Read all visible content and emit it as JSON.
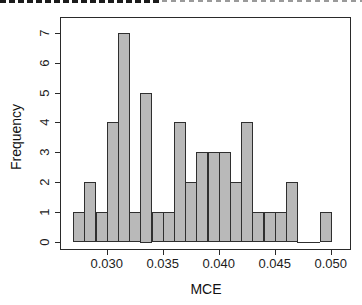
{
  "chart_data": {
    "type": "bar",
    "subtype": "histogram",
    "title": "",
    "xlabel": "MCE",
    "ylabel": "Frequency",
    "xlim": [
      0.027,
      0.05
    ],
    "ylim": [
      0,
      7
    ],
    "bin_width": 0.001,
    "grid": "off",
    "legend": "none",
    "total_count": 50,
    "bins": [
      {
        "from": 0.027,
        "to": 0.028,
        "count": 1
      },
      {
        "from": 0.028,
        "to": 0.029,
        "count": 2
      },
      {
        "from": 0.029,
        "to": 0.03,
        "count": 1
      },
      {
        "from": 0.03,
        "to": 0.031,
        "count": 4
      },
      {
        "from": 0.031,
        "to": 0.032,
        "count": 7
      },
      {
        "from": 0.032,
        "to": 0.033,
        "count": 1
      },
      {
        "from": 0.033,
        "to": 0.034,
        "count": 5
      },
      {
        "from": 0.034,
        "to": 0.035,
        "count": 1
      },
      {
        "from": 0.035,
        "to": 0.036,
        "count": 1
      },
      {
        "from": 0.036,
        "to": 0.037,
        "count": 4
      },
      {
        "from": 0.037,
        "to": 0.038,
        "count": 2
      },
      {
        "from": 0.038,
        "to": 0.039,
        "count": 3
      },
      {
        "from": 0.039,
        "to": 0.04,
        "count": 3
      },
      {
        "from": 0.04,
        "to": 0.041,
        "count": 3
      },
      {
        "from": 0.041,
        "to": 0.042,
        "count": 2
      },
      {
        "from": 0.042,
        "to": 0.043,
        "count": 4
      },
      {
        "from": 0.043,
        "to": 0.044,
        "count": 1
      },
      {
        "from": 0.044,
        "to": 0.045,
        "count": 1
      },
      {
        "from": 0.045,
        "to": 0.046,
        "count": 1
      },
      {
        "from": 0.046,
        "to": 0.047,
        "count": 2
      },
      {
        "from": 0.047,
        "to": 0.048,
        "count": 0
      },
      {
        "from": 0.048,
        "to": 0.049,
        "count": 0
      },
      {
        "from": 0.049,
        "to": 0.05,
        "count": 1
      }
    ],
    "x_ticks": [
      {
        "value": 0.03,
        "label": "0.030"
      },
      {
        "value": 0.035,
        "label": "0.035"
      },
      {
        "value": 0.04,
        "label": "0.040"
      },
      {
        "value": 0.045,
        "label": "0.045"
      },
      {
        "value": 0.05,
        "label": "0.050"
      }
    ],
    "y_ticks": [
      {
        "value": 0,
        "label": "0"
      },
      {
        "value": 1,
        "label": "1"
      },
      {
        "value": 2,
        "label": "2"
      },
      {
        "value": 3,
        "label": "3"
      },
      {
        "value": 4,
        "label": "4"
      },
      {
        "value": 5,
        "label": "5"
      },
      {
        "value": 6,
        "label": "6"
      },
      {
        "value": 7,
        "label": "7"
      }
    ],
    "colors": {
      "bar_fill": "#b9b9b9",
      "bar_stroke": "#2f2f2f",
      "axis": "#2a2a2a",
      "text": "#1c1c1c",
      "background": "#ffffff"
    }
  }
}
